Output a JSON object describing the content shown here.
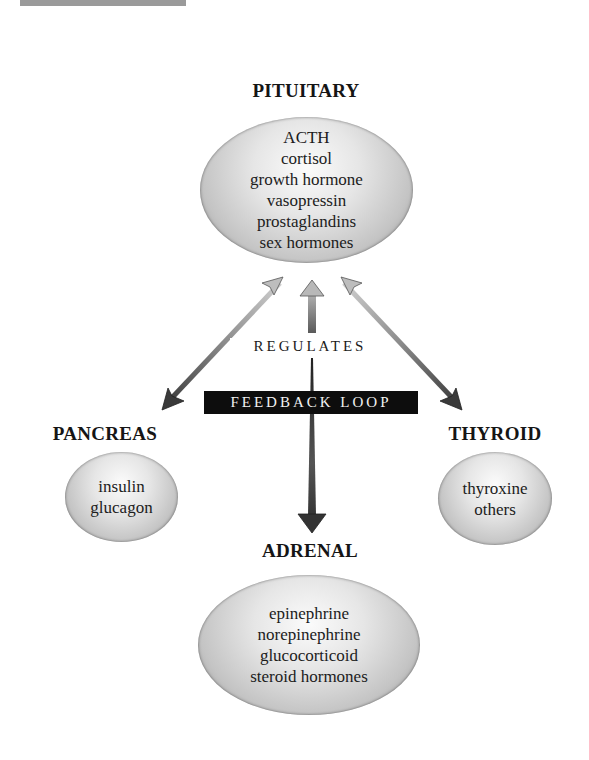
{
  "decor": {
    "top_bar_color": "#9a9a9a"
  },
  "nodes": {
    "pituitary": {
      "title": "PITUITARY",
      "items": [
        "ACTH",
        "cortisol",
        "growth hormone",
        "vasopressin",
        "prostaglandins",
        "sex hormones"
      ]
    },
    "pancreas": {
      "title": "PANCREAS",
      "items": [
        "insulin",
        "glucagon"
      ]
    },
    "thyroid": {
      "title": "THYROID",
      "items": [
        "thyroxine",
        "others"
      ]
    },
    "adrenal": {
      "title": "ADRENAL",
      "items": [
        "epinephrine",
        "norepinephrine",
        "glucocorticoid",
        "steroid hormones"
      ]
    }
  },
  "labels": {
    "regulates": "REGULATES",
    "feedback_loop": "FEEDBACK LOOP"
  },
  "edges": [
    {
      "from": "pancreas",
      "to": "pituitary",
      "type": "double-arrow"
    },
    {
      "from": "thyroid",
      "to": "pituitary",
      "type": "double-arrow"
    },
    {
      "from": "adrenal",
      "to": "pituitary",
      "type": "up-arrow"
    },
    {
      "from": "pituitary",
      "to": "adrenal",
      "type": "down-arrow"
    }
  ],
  "colors": {
    "feedback_bg": "#0d0d0d",
    "feedback_text": "#f2f2f2",
    "arrow_light": "#c8c8c8",
    "arrow_dark": "#3a3a3a"
  }
}
